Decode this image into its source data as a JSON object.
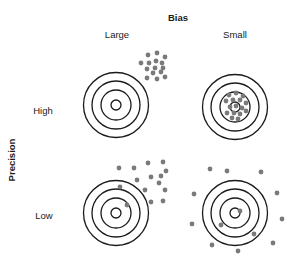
{
  "labels": {
    "bias_title": "Bias",
    "bias_large": "Large",
    "bias_small": "Small",
    "precision_title": "Precision",
    "precision_high": "High",
    "precision_low": "Low"
  },
  "colors": {
    "ring": "#1a1a1a",
    "dot": "#7a7a7a"
  },
  "targets": [
    {
      "name": "high-precision-large-bias",
      "center": [
        116,
        105
      ],
      "dots": [
        [
          148,
          55
        ],
        [
          157,
          53
        ],
        [
          165,
          57
        ],
        [
          141,
          63
        ],
        [
          149,
          63
        ],
        [
          156,
          61
        ],
        [
          162,
          63
        ],
        [
          147,
          69
        ],
        [
          155,
          68
        ],
        [
          163,
          68
        ],
        [
          153,
          73
        ],
        [
          161,
          72
        ],
        [
          147,
          78
        ],
        [
          157,
          79
        ],
        [
          165,
          77
        ]
      ]
    },
    {
      "name": "high-precision-small-bias",
      "center": [
        235,
        107
      ],
      "dots": [
        [
          229,
          95
        ],
        [
          236,
          93
        ],
        [
          243,
          96
        ],
        [
          226,
          101
        ],
        [
          233,
          100
        ],
        [
          240,
          100
        ],
        [
          246,
          103
        ],
        [
          230,
          107
        ],
        [
          236,
          106
        ],
        [
          242,
          108
        ],
        [
          227,
          113
        ],
        [
          234,
          113
        ],
        [
          240,
          114
        ],
        [
          246,
          111
        ],
        [
          232,
          118
        ],
        [
          238,
          119
        ]
      ]
    },
    {
      "name": "low-precision-large-bias",
      "center": [
        116,
        213
      ],
      "dots": [
        [
          119,
          168
        ],
        [
          134,
          168
        ],
        [
          148,
          163
        ],
        [
          163,
          162
        ],
        [
          166,
          171
        ],
        [
          137,
          180
        ],
        [
          151,
          177
        ],
        [
          161,
          176
        ],
        [
          159,
          183
        ],
        [
          120,
          187
        ],
        [
          145,
          190
        ],
        [
          165,
          190
        ],
        [
          151,
          202
        ],
        [
          163,
          201
        ],
        [
          127,
          205
        ]
      ]
    },
    {
      "name": "low-precision-small-bias",
      "center": [
        235,
        213
      ],
      "dots": [
        [
          210,
          169
        ],
        [
          227,
          171
        ],
        [
          261,
          172
        ],
        [
          194,
          194
        ],
        [
          277,
          193
        ],
        [
          240,
          211
        ],
        [
          192,
          224
        ],
        [
          282,
          219
        ],
        [
          221,
          225
        ],
        [
          254,
          234
        ],
        [
          212,
          245
        ],
        [
          273,
          243
        ],
        [
          238,
          251
        ]
      ]
    }
  ],
  "ring_radii": [
    32.5,
    24,
    15,
    5
  ]
}
